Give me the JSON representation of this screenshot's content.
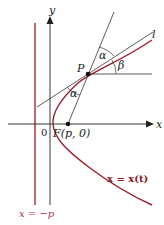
{
  "labels": {
    "y_axis": "y",
    "x_axis": "x",
    "line": "l",
    "point_p": "P",
    "origin": "0",
    "focus": "F(p, 0)",
    "alpha_top": "α",
    "alpha_bottom": "α",
    "beta": "β",
    "curve": "x = x(t)",
    "directrix": "x = −p"
  },
  "colors": {
    "curve": "#9a1f2e",
    "directrix": "#a8283a",
    "axes": "#222222",
    "lines": "#333333"
  }
}
